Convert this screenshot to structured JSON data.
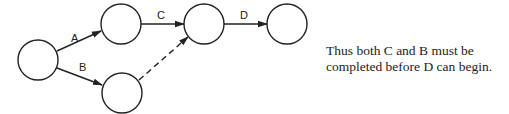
{
  "diagram": {
    "type": "activity-on-arrow network",
    "nodes": [
      {
        "id": "n1",
        "label": ""
      },
      {
        "id": "n2",
        "label": ""
      },
      {
        "id": "n3",
        "label": ""
      },
      {
        "id": "n4",
        "label": ""
      },
      {
        "id": "n5",
        "label": ""
      }
    ],
    "edges": [
      {
        "id": "A",
        "label": "A",
        "from": "n1",
        "to": "n2",
        "style": "solid"
      },
      {
        "id": "B",
        "label": "B",
        "from": "n1",
        "to": "n3",
        "style": "solid"
      },
      {
        "id": "C",
        "label": "C",
        "from": "n2",
        "to": "n4",
        "style": "solid"
      },
      {
        "id": "dummy",
        "label": "",
        "from": "n3",
        "to": "n4",
        "style": "dashed"
      },
      {
        "id": "D",
        "label": "D",
        "from": "n4",
        "to": "n5",
        "style": "solid"
      }
    ],
    "colors": {
      "stroke": "#222222",
      "background": "#ffffff"
    }
  },
  "caption": {
    "line1": "Thus both C and B must be",
    "line2": "completed before D can begin."
  }
}
